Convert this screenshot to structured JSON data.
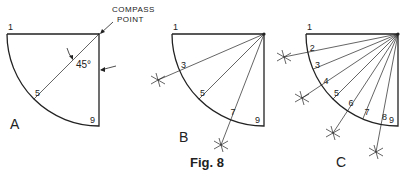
{
  "figure": {
    "caption": "Fig. 8",
    "compass_label_line1": "COMPASS",
    "compass_label_line2": "POINT",
    "angle_label": "45°"
  },
  "panels": [
    {
      "id": "A",
      "label": "A",
      "center": [
        99,
        34
      ],
      "radius": 92,
      "divisions": [
        1,
        5,
        9
      ],
      "label_pos": [
        10,
        129
      ],
      "radials_to": [
        5
      ],
      "crosses": []
    },
    {
      "id": "B",
      "label": "B",
      "center": [
        264,
        34
      ],
      "radius": 92,
      "divisions": [
        1,
        3,
        5,
        7,
        9
      ],
      "label_pos": [
        179,
        142
      ],
      "radials_to": [
        3,
        5,
        7
      ],
      "crosses": [
        [
          158,
          80
        ],
        [
          221,
          145
        ]
      ]
    },
    {
      "id": "C",
      "label": "C",
      "center": [
        398,
        34
      ],
      "radius": 92,
      "divisions": [
        1,
        2,
        3,
        4,
        5,
        6,
        7,
        8,
        9
      ],
      "label_pos": [
        336,
        167
      ],
      "radials_to": [
        2,
        3,
        4,
        5,
        6,
        7,
        8
      ],
      "crosses": [
        [
          284,
          57
        ],
        [
          302,
          98
        ],
        [
          333,
          133
        ],
        [
          376,
          152
        ]
      ]
    }
  ],
  "colors": {
    "ink": "#222222",
    "paper": "#ffffff"
  }
}
